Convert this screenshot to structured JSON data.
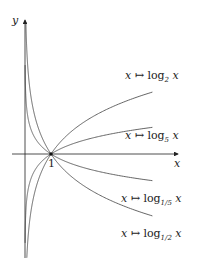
{
  "chart_data": {
    "type": "line",
    "title": "",
    "xlabel": "x",
    "ylabel": "y",
    "xlim": [
      0,
      6.6
    ],
    "ylim": [
      -4.2,
      5.1
    ],
    "grid": false,
    "annotations": [
      {
        "x": 1,
        "y": 0,
        "text": "1",
        "marker": "point"
      }
    ],
    "series": [
      {
        "name": "x ↦ log_2 x",
        "base": 2,
        "label_fn": "log",
        "label_sub": "2",
        "label_y": 2.3
      },
      {
        "name": "x ↦ log_5 x",
        "base": 5,
        "label_fn": "log",
        "label_sub": "5",
        "label_y": 1.0
      },
      {
        "name": "x ↦ log_1/5 x",
        "base": 0.2,
        "label_fn": "log",
        "label_sub": "1/5",
        "label_y": -1.0
      },
      {
        "name": "x ↦ log_1/2 x",
        "base": 0.5,
        "label_fn": "log",
        "label_sub": "1/2",
        "label_y": -2.3
      }
    ],
    "x_domain": [
      0.005,
      4.9
    ]
  },
  "axes": {
    "x_label": "x",
    "y_label": "y",
    "tick_one": "1"
  },
  "labels": [
    {
      "prefix": "x ↦ ",
      "fn": "log",
      "sub": "2",
      "var": " x"
    },
    {
      "prefix": "x ↦ ",
      "fn": "log",
      "sub": "5",
      "var": " x"
    },
    {
      "prefix": "x ↦ ",
      "fn": "log",
      "sub": "1/5",
      "var": " x"
    },
    {
      "prefix": "x ↦ ",
      "fn": "log",
      "sub": "1/2",
      "var": " x"
    }
  ]
}
